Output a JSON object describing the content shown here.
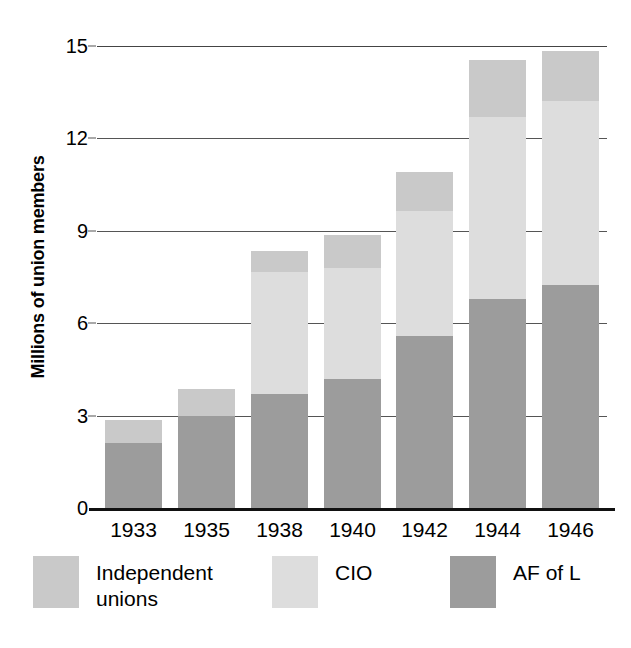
{
  "chart_data": {
    "type": "bar",
    "subtype": "stacked-vertical",
    "title": "",
    "xlabel": "",
    "ylabel": "Millions of union members",
    "categories": [
      "1933",
      "1935",
      "1938",
      "1940",
      "1942",
      "1944",
      "1946"
    ],
    "ylim": [
      0,
      15
    ],
    "yticks": [
      0,
      3,
      6,
      9,
      12,
      15
    ],
    "ytick_labels": [
      "0",
      "3",
      "6",
      "9",
      "12",
      "15"
    ],
    "grid": true,
    "grid_axis": "y",
    "legend_position": "bottom",
    "stack_order_bottom_to_top": [
      "AF of L",
      "CIO",
      "Independent unions"
    ],
    "series": [
      {
        "name": "AF of L",
        "color": "#9c9c9c",
        "values": [
          2.1,
          3.0,
          3.7,
          4.2,
          5.6,
          6.8,
          7.25
        ]
      },
      {
        "name": "CIO",
        "color": "#dddddd",
        "values": [
          0.0,
          0.0,
          3.95,
          3.6,
          4.05,
          5.9,
          5.95
        ]
      },
      {
        "name": "Independent unions",
        "color": "#c9c9c9",
        "values": [
          0.75,
          0.85,
          0.7,
          1.05,
          1.25,
          1.85,
          1.65
        ]
      }
    ],
    "totals": [
      2.85,
      3.85,
      8.35,
      8.85,
      10.9,
      14.55,
      14.85
    ]
  },
  "axis": {
    "y_title": "Millions of union members",
    "y_labels": [
      "15",
      "12",
      "9",
      "6",
      "3",
      "0"
    ],
    "x_labels": [
      "1933",
      "1935",
      "1938",
      "1940",
      "1942",
      "1944",
      "1946"
    ]
  },
  "legend": {
    "items": [
      {
        "label": "Independent\nunions",
        "color": "#c9c9c9"
      },
      {
        "label": "CIO",
        "color": "#dddddd"
      },
      {
        "label": "AF of L",
        "color": "#9c9c9c"
      }
    ]
  },
  "colors": {
    "afl": "#9c9c9c",
    "cio": "#dddddd",
    "independent": "#c9c9c9",
    "gridline": "#555555",
    "baseline": "#111111",
    "background": "#ffffff",
    "text": "#000000"
  }
}
